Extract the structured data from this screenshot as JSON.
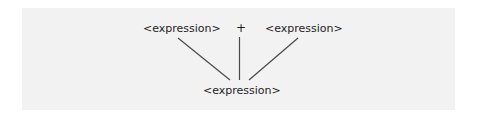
{
  "diagram": {
    "type": "parse-tree",
    "top_row": [
      {
        "label": "<expression>"
      },
      {
        "label": "+"
      },
      {
        "label": "<expression>"
      }
    ],
    "root": {
      "label": "<expression>"
    },
    "colors": {
      "background": "#f2f2f2",
      "line": "#4a4a4a",
      "text": "#1e1e1e"
    }
  }
}
